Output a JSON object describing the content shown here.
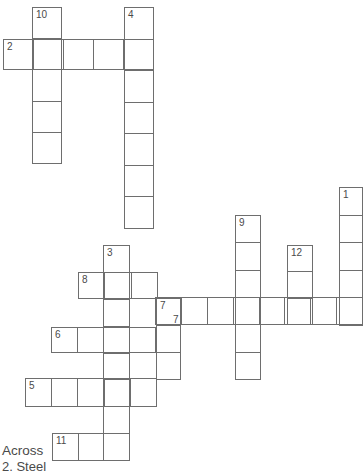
{
  "puzzle": {
    "grid_line_color": "#6e6e6e",
    "number_color": "#4a4a4a",
    "words": [
      {
        "number": "10",
        "direction": "down",
        "label": "10",
        "x": 32,
        "y": 7,
        "cells": 5,
        "w": 30,
        "h": 157
      },
      {
        "number": "4",
        "direction": "down",
        "label": "4",
        "x": 124,
        "y": 7,
        "cells": 7,
        "w": 30,
        "h": 222
      },
      {
        "number": "2",
        "direction": "across",
        "label": "2",
        "x": 3,
        "y": 39,
        "cells": 5,
        "w": 151,
        "h": 31
      },
      {
        "number": "1",
        "direction": "down",
        "label": "1",
        "x": 339,
        "y": 187,
        "cells": 5,
        "w": 24,
        "h": 139
      },
      {
        "number": "9",
        "direction": "down",
        "label": "9",
        "x": 235,
        "y": 215,
        "cells": 6,
        "w": 26,
        "h": 165
      },
      {
        "number": "12",
        "direction": "down",
        "label": "12",
        "x": 287,
        "y": 245,
        "cells": 3,
        "w": 26,
        "h": 80
      },
      {
        "number": "3",
        "direction": "down",
        "label": "3",
        "x": 103,
        "y": 245,
        "cells": 8,
        "w": 27,
        "h": 216
      },
      {
        "number": "8",
        "direction": "across",
        "label": "8",
        "x": 78,
        "y": 272,
        "cells": 3,
        "w": 80,
        "h": 27
      },
      {
        "number": "7",
        "direction": "across",
        "label": "7",
        "label_dx": 17,
        "label_dy": 16,
        "x": 155,
        "y": 297,
        "cells": 8,
        "w": 208,
        "h": 28
      },
      {
        "number": "7",
        "direction": "down",
        "label": "7",
        "x": 156,
        "y": 298,
        "cells": 3,
        "w": 25,
        "h": 82
      },
      {
        "number": "6",
        "direction": "across",
        "label": "6",
        "x": 51,
        "y": 327,
        "cells": 4,
        "w": 105,
        "h": 26
      },
      {
        "number": "5",
        "direction": "across",
        "label": "5",
        "x": 25,
        "y": 378,
        "cells": 5,
        "w": 132,
        "h": 29
      },
      {
        "number": "11",
        "direction": "across",
        "label": "11",
        "x": 52,
        "y": 433,
        "cells": 3,
        "w": 78,
        "h": 28
      }
    ]
  },
  "clues": {
    "across_heading": "Across",
    "first_clue_partial": "2. Steel"
  }
}
